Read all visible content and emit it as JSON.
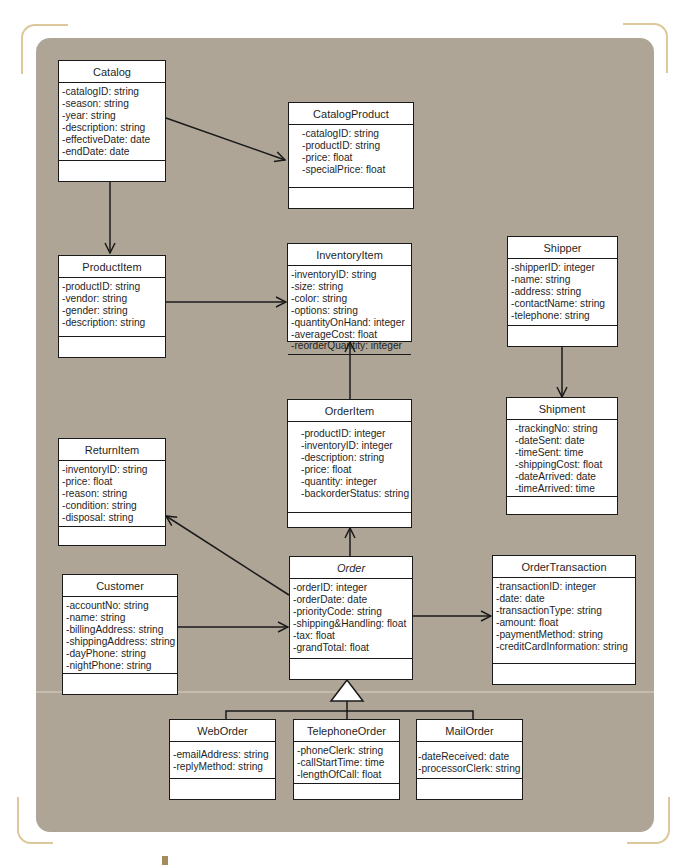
{
  "diagram": {
    "type": "UML class diagram",
    "colors": {
      "panel_background": "#aea596",
      "corner_brackets": "#dcc89a",
      "class_box_fill": "#ffffff",
      "lines": "#1a1a1a"
    },
    "classes": {
      "catalog": {
        "name": "Catalog",
        "attributes": [
          "-catalogID: string",
          "-season: string",
          "-year: string",
          "-description: string",
          "-effectiveDate: date",
          "-endDate: date"
        ]
      },
      "catalog_product": {
        "name": "CatalogProduct",
        "attributes": [
          "-catalogID: string",
          "-productID: string",
          "-price: float",
          "-specialPrice: float"
        ]
      },
      "product_item": {
        "name": "ProductItem",
        "attributes": [
          "-productID: string",
          "-vendor: string",
          "-gender: string",
          "-description: string"
        ]
      },
      "inventory_item": {
        "name": "InventoryItem",
        "attributes": [
          "-inventoryID: string",
          "-size: string",
          "-color: string",
          "-options: string",
          "-quantityOnHand: integer",
          "-averageCost: float",
          "-reorderQuantity: integer"
        ]
      },
      "shipper": {
        "name": "Shipper",
        "attributes": [
          "-shipperID: integer",
          "-name: string",
          "-address: string",
          "-contactName: string",
          "-telephone: string"
        ]
      },
      "shipment": {
        "name": "Shipment",
        "attributes": [
          "-trackingNo: string",
          "-dateSent: date",
          "-timeSent: time",
          "-shippingCost: float",
          "-dateArrived: date",
          "-timeArrived: time"
        ]
      },
      "order_item": {
        "name": "OrderItem",
        "attributes": [
          "-productID: integer",
          "-inventoryID: integer",
          "-description: string",
          "-price: float",
          "-quantity: integer",
          "-backorderStatus: string"
        ]
      },
      "return_item": {
        "name": "ReturnItem",
        "attributes": [
          "-inventoryID: string",
          "-price: float",
          "-reason: string",
          "-condition: string",
          "-disposal: string"
        ]
      },
      "customer": {
        "name": "Customer",
        "attributes": [
          "-accountNo: string",
          "-name: string",
          "-billingAddress: string",
          "-shippingAddress: string",
          "-dayPhone: string",
          "-nightPhone: string"
        ]
      },
      "order": {
        "name": "Order",
        "abstract": true,
        "attributes": [
          "-orderID: integer",
          "-orderDate: date",
          "-priorityCode: string",
          "-shipping&Handling: float",
          "-tax: float",
          "-grandTotal: float"
        ]
      },
      "order_transaction": {
        "name": "OrderTransaction",
        "attributes": [
          "-transactionID: integer",
          "-date: date",
          "-transactionType: string",
          "-amount: float",
          "-paymentMethod: string",
          "-creditCardInformation: string"
        ]
      },
      "web_order": {
        "name": "WebOrder",
        "attributes": [
          "-emailAddress: string",
          "-replyMethod: string"
        ]
      },
      "telephone_order": {
        "name": "TelephoneOrder",
        "attributes": [
          "-phoneClerk: string",
          "-callStartTime: time",
          "-lengthOfCall: float"
        ]
      },
      "mail_order": {
        "name": "MailOrder",
        "attributes": [
          "-dateReceived: date",
          "-processorClerk: string"
        ]
      }
    },
    "relationships": [
      {
        "from": "Catalog",
        "to": "CatalogProduct",
        "type": "association-arrow"
      },
      {
        "from": "Catalog",
        "to": "ProductItem",
        "type": "association-arrow"
      },
      {
        "from": "ProductItem",
        "to": "InventoryItem",
        "type": "association-arrow"
      },
      {
        "from": "OrderItem",
        "to": "InventoryItem",
        "type": "association-arrow"
      },
      {
        "from": "Shipper",
        "to": "Shipment",
        "type": "association-arrow"
      },
      {
        "from": "Order",
        "to": "OrderItem",
        "type": "association-arrow"
      },
      {
        "from": "Order",
        "to": "ReturnItem",
        "type": "association-arrow"
      },
      {
        "from": "Customer",
        "to": "Order",
        "type": "association-arrow"
      },
      {
        "from": "Order",
        "to": "OrderTransaction",
        "type": "association-arrow"
      },
      {
        "from": "WebOrder",
        "to": "Order",
        "type": "generalization"
      },
      {
        "from": "TelephoneOrder",
        "to": "Order",
        "type": "generalization"
      },
      {
        "from": "MailOrder",
        "to": "Order",
        "type": "generalization"
      }
    ]
  }
}
